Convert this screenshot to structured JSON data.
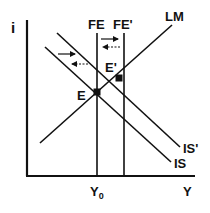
{
  "diagram": {
    "type": "IS-LM-FE",
    "axes": {
      "y_label": "i",
      "x_label": "Y",
      "x_tick_label_base": "Y",
      "x_tick_label_sub": "0"
    },
    "curves": {
      "lm": "LM",
      "is": "IS",
      "is_prime": "IS'",
      "fe": "FE",
      "fe_prime": "FE'"
    },
    "points": {
      "e": "E",
      "e_prime": "E'"
    },
    "arrows": [
      {
        "style": "solid",
        "direction": "right",
        "location": "left of FE"
      },
      {
        "style": "dashed",
        "direction": "left",
        "location": "left of FE"
      },
      {
        "style": "solid",
        "direction": "right",
        "location": "between FE and FE'"
      },
      {
        "style": "dashed",
        "direction": "left",
        "location": "between FE and FE'"
      }
    ],
    "colors": {
      "line": "#111111",
      "background": "#ffffff"
    }
  }
}
